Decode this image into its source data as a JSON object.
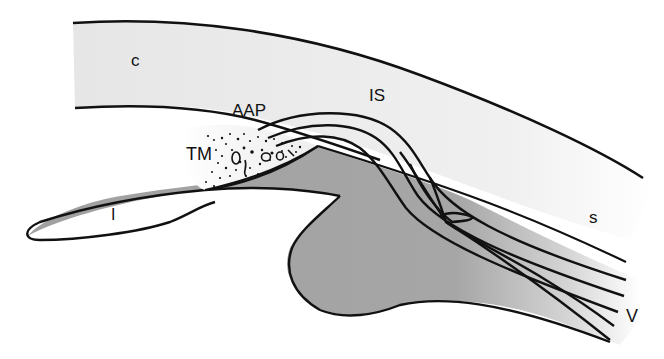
{
  "figure": {
    "type": "anatomical-diagram",
    "colors": {
      "cornea_sclera_fill": "#ececec",
      "iris_ciliary_fill": "#a3a3a3",
      "trabecular_fill": "#f4f4f4",
      "outline": "#111111",
      "background": "#ffffff"
    }
  },
  "labels": {
    "cornea": "c",
    "anterior_angle_pathway": "AAP",
    "intrascleral": "IS",
    "trabecular_meshwork": "TM",
    "iris": "I",
    "sclera": "s",
    "veins": "V"
  }
}
